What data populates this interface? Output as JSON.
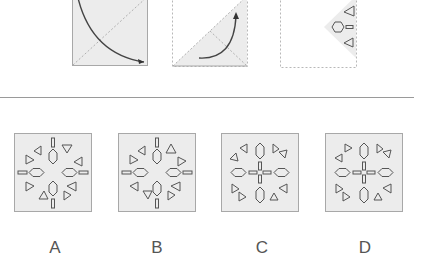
{
  "puzzle": {
    "colors": {
      "panel_fill": "#ececec",
      "panel_border": "#a8a8a8",
      "stroke": "#555555",
      "arrow": "#444444"
    },
    "fold_steps": [
      {
        "step": 1,
        "description": "square folded along diagonal, curved arrow sweeping down-right"
      },
      {
        "step": 2,
        "description": "triangle folded again, curved arrow sweeping up-right"
      },
      {
        "step": 3,
        "description": "folded wedge with cut shapes: two triangles, one hexagon and a short bar"
      }
    ],
    "options": [
      {
        "label": "A"
      },
      {
        "label": "B"
      },
      {
        "label": "C"
      },
      {
        "label": "D"
      }
    ]
  }
}
